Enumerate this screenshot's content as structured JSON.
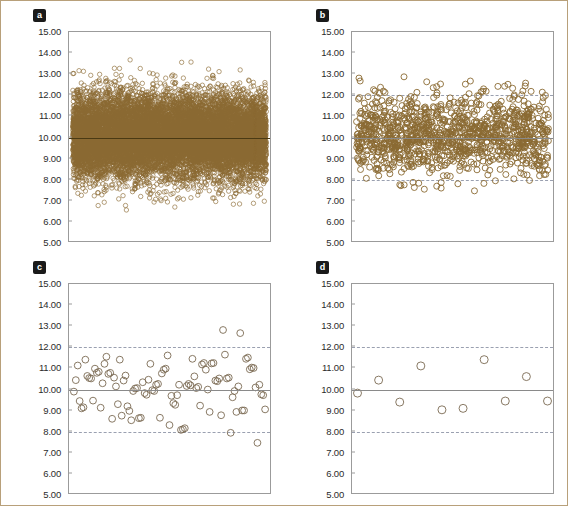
{
  "figure": {
    "panels": [
      {
        "id": "a",
        "label": "a",
        "n_points": 12000
      },
      {
        "id": "b",
        "label": "b",
        "n_points": 1200
      },
      {
        "id": "c",
        "label": "c",
        "n_points": 110
      },
      {
        "id": "d",
        "label": "d",
        "n_points": 10
      }
    ]
  },
  "chart_data": [
    {
      "type": "scatter",
      "panel": "a",
      "title": "a",
      "xlabel": "",
      "ylabel": "",
      "ylim": [
        5.0,
        15.0
      ],
      "ytick_labels": [
        "15.00",
        "14.00",
        "13.00",
        "12.00",
        "11.00",
        "10.00",
        "9.00",
        "8.00",
        "7.00",
        "6.00",
        "5.00"
      ],
      "ytick_values": [
        15,
        14,
        13,
        12,
        11,
        10,
        9,
        8,
        7,
        6,
        5
      ],
      "grid": false,
      "legend": "none",
      "center_line": 10.0,
      "center_line_style": "solid",
      "limit_lines": [
        8.0,
        12.0
      ],
      "limit_line_style": "dashed",
      "limit_lines_visible": false,
      "n_points": 12000,
      "marker": "open-circle",
      "marker_size_px": 2.2,
      "marker_color": "#8a6a32",
      "mean": 10.0,
      "sd": 1.0,
      "value_range": [
        6.1,
        13.9
      ],
      "notes": "Very dense scatter; points fill 7.0-13.0 with outliers to 6.1 and 13.9; limit lines obscured by density"
    },
    {
      "type": "scatter",
      "panel": "b",
      "title": "b",
      "xlabel": "",
      "ylabel": "",
      "ylim": [
        5.0,
        15.0
      ],
      "ytick_labels": [
        "15.00",
        "14.00",
        "13.00",
        "12.00",
        "11.00",
        "10.00",
        "9.00",
        "8.00",
        "7.00",
        "6.00",
        "5.00"
      ],
      "ytick_values": [
        15,
        14,
        13,
        12,
        11,
        10,
        9,
        8,
        7,
        6,
        5
      ],
      "grid": false,
      "legend": "none",
      "center_line": 10.0,
      "center_line_style": "solid",
      "limit_lines": [
        8.0,
        12.0
      ],
      "limit_line_style": "dashed",
      "limit_lines_visible": true,
      "n_points": 1200,
      "marker": "open-circle",
      "marker_size_px": 3.0,
      "marker_color": "#8a6a32",
      "mean": 10.0,
      "sd": 1.0,
      "value_range": [
        6.6,
        13.0
      ],
      "notes": "Moderately dense scatter; bulk between 8 and 12, outliers at 13.0, 12.95, 12.8, 7.3, 6.7, 6.6"
    },
    {
      "type": "scatter",
      "panel": "c",
      "title": "c",
      "xlabel": "",
      "ylabel": "",
      "ylim": [
        5.0,
        15.0
      ],
      "ytick_labels": [
        "15.00",
        "14.00",
        "13.00",
        "12.00",
        "11.00",
        "10.00",
        "9.00",
        "8.00",
        "7.00",
        "6.00",
        "5.00"
      ],
      "ytick_values": [
        15,
        14,
        13,
        12,
        11,
        10,
        9,
        8,
        7,
        6,
        5
      ],
      "grid": false,
      "legend": "none",
      "center_line": 10.0,
      "center_line_style": "solid",
      "limit_lines": [
        8.0,
        12.0
      ],
      "limit_line_style": "dashed",
      "limit_lines_visible": true,
      "n_points": 110,
      "marker": "open-circle",
      "marker_size_px": 3.4,
      "marker_color": "#7a6a52",
      "mean": 10.0,
      "sd": 1.0,
      "value_range": [
        7.4,
        12.8
      ],
      "values": [
        9.85,
        10.4,
        11.1,
        9.4,
        9.05,
        9.1,
        11.38,
        10.6,
        10.5,
        10.48,
        9.42,
        10.95,
        10.75,
        10.8,
        9.08,
        10.25,
        11.18,
        11.52,
        10.7,
        10.75,
        8.55,
        10.52,
        10.1,
        9.25,
        11.38,
        8.7,
        10.38,
        10.62,
        9.15,
        8.93,
        8.48,
        9.88,
        10.0,
        10.02,
        8.58,
        8.6,
        10.3,
        9.78,
        9.7,
        10.42,
        11.18,
        9.92,
        9.88,
        10.18,
        10.22,
        8.6,
        10.72,
        10.9,
        10.95,
        11.58,
        8.25,
        9.65,
        9.3,
        9.22,
        9.68,
        10.18,
        8.02,
        8.05,
        8.1,
        10.12,
        10.22,
        10.15,
        11.42,
        10.58,
        10.02,
        10.08,
        9.18,
        11.15,
        11.22,
        10.9,
        9.95,
        8.88,
        11.2,
        11.22,
        10.38,
        10.35,
        10.48,
        8.72,
        12.8,
        11.62,
        10.48,
        10.52,
        7.88,
        9.58,
        9.88,
        8.88,
        10.1,
        12.65,
        8.95,
        8.95,
        11.42,
        11.48,
        10.92,
        11.0,
        10.98,
        10.05,
        7.4,
        10.18,
        9.72,
        9.68,
        9.0
      ],
      "notes": "Sparse scatter, ~100-110 points, most within 8-12; outliers 12.80, 12.65, 7.88, 7.40"
    },
    {
      "type": "scatter",
      "panel": "d",
      "title": "d",
      "xlabel": "",
      "ylabel": "",
      "ylim": [
        5.0,
        15.0
      ],
      "ytick_labels": [
        "15.00",
        "14.00",
        "13.00",
        "12.00",
        "11.00",
        "10.00",
        "9.00",
        "8.00",
        "7.00",
        "6.00",
        "5.00"
      ],
      "ytick_values": [
        15,
        14,
        13,
        12,
        11,
        10,
        9,
        8,
        7,
        6,
        5
      ],
      "grid": false,
      "legend": "none",
      "center_line": 10.0,
      "center_line_style": "solid",
      "limit_lines": [
        8.0,
        12.0
      ],
      "limit_line_style": "dashed",
      "limit_lines_visible": true,
      "n_points": 10,
      "marker": "open-circle",
      "marker_size_px": 4.0,
      "marker_color": "#7a6a52",
      "mean": 10.0,
      "sd": 1.0,
      "x": [
        1,
        2,
        3,
        4,
        5,
        6,
        7,
        8,
        9,
        10
      ],
      "values": [
        9.78,
        10.4,
        9.35,
        11.08,
        8.98,
        9.05,
        11.38,
        9.4,
        10.57,
        9.4
      ],
      "value_range": [
        8.98,
        11.38
      ],
      "notes": "Only 10 points, all well inside the 8-12 limit lines"
    }
  ]
}
